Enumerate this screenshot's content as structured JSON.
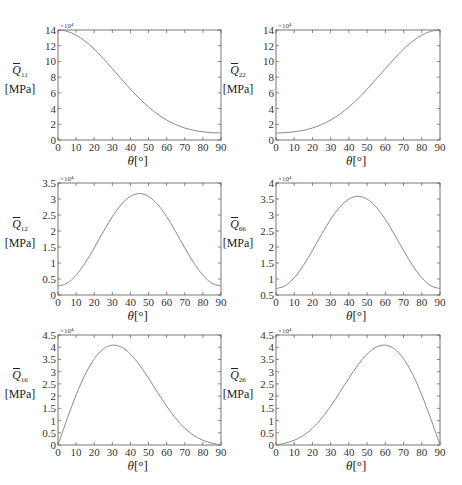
{
  "figure": {
    "xlabel_symbol": "θ",
    "xlabel_unit": "[°]",
    "ylabel_unit": "[MPa]",
    "multiplier": "×10⁴",
    "line_color": "#8a8a8a",
    "axis_color": "#555555"
  },
  "chart_data": [
    {
      "type": "line",
      "id": "Q11",
      "title": "",
      "ylabel_symbol": "Q",
      "ylabel_sub": "11",
      "ylabel": "Q̄11 [MPa]",
      "xlabel": "θ[°]",
      "multiplier": "×10^4",
      "xlim": [
        0,
        90
      ],
      "ylim": [
        0,
        14
      ],
      "xticks": [
        0,
        10,
        20,
        30,
        40,
        50,
        60,
        70,
        80,
        90
      ],
      "yticks": [
        0,
        2,
        4,
        6,
        8,
        10,
        12,
        14
      ],
      "ytick_labels": [
        "0",
        "2",
        "4",
        "6",
        "8",
        "10",
        "12",
        "14"
      ],
      "x": [
        0,
        5,
        10,
        15,
        20,
        25,
        30,
        35,
        40,
        45,
        50,
        55,
        60,
        65,
        70,
        75,
        80,
        85,
        90
      ],
      "values": [
        14.0,
        13.835,
        13.35,
        12.576,
        11.565,
        10.378,
        9.086,
        7.761,
        6.468,
        5.265,
        4.194,
        3.28,
        2.536,
        1.958,
        1.53,
        1.231,
        1.039,
        0.934,
        0.9
      ]
    },
    {
      "type": "line",
      "id": "Q22",
      "title": "",
      "ylabel_symbol": "Q",
      "ylabel_sub": "22",
      "ylabel": "Q̄22 [MPa]",
      "xlabel": "θ[°]",
      "multiplier": "×10^4",
      "xlim": [
        0,
        90
      ],
      "ylim": [
        0,
        14
      ],
      "xticks": [
        0,
        10,
        20,
        30,
        40,
        50,
        60,
        70,
        80,
        90
      ],
      "yticks": [
        0,
        2,
        4,
        6,
        8,
        10,
        12,
        14
      ],
      "ytick_labels": [
        "0",
        "2",
        "4",
        "6",
        "8",
        "10",
        "12",
        "14"
      ],
      "x": [
        0,
        5,
        10,
        15,
        20,
        25,
        30,
        35,
        40,
        45,
        50,
        55,
        60,
        65,
        70,
        75,
        80,
        85,
        90
      ],
      "values": [
        0.9,
        0.934,
        1.039,
        1.231,
        1.53,
        1.958,
        2.536,
        3.28,
        4.194,
        5.265,
        6.468,
        7.761,
        9.086,
        10.378,
        11.565,
        12.576,
        13.35,
        13.835,
        14.0
      ]
    },
    {
      "type": "line",
      "id": "Q12",
      "title": "",
      "ylabel_symbol": "Q",
      "ylabel_sub": "12",
      "ylabel": "Q̄12 [MPa]",
      "xlabel": "θ[°]",
      "multiplier": "×10^4",
      "xlim": [
        0,
        90
      ],
      "ylim": [
        0,
        3.5
      ],
      "xticks": [
        0,
        10,
        20,
        30,
        40,
        50,
        60,
        70,
        80,
        90
      ],
      "yticks": [
        0,
        0.5,
        1,
        1.5,
        2,
        2.5,
        3,
        3.5
      ],
      "ytick_labels": [
        "0",
        "0.5",
        "1",
        "1.5",
        "2",
        "2.5",
        "3",
        "3.5"
      ],
      "x": [
        0,
        5,
        10,
        15,
        20,
        25,
        30,
        35,
        40,
        45,
        50,
        55,
        60,
        65,
        70,
        75,
        80,
        85,
        90
      ],
      "values": [
        0.28,
        0.367,
        0.618,
        1.003,
        1.474,
        1.976,
        2.448,
        2.832,
        3.083,
        3.17,
        3.083,
        2.832,
        2.448,
        1.976,
        1.474,
        1.003,
        0.618,
        0.367,
        0.28
      ]
    },
    {
      "type": "line",
      "id": "Q66",
      "title": "",
      "ylabel_symbol": "Q",
      "ylabel_sub": "66",
      "ylabel": "Q̄66 [MPa]",
      "xlabel": "θ[°]",
      "multiplier": "×10^4",
      "xlim": [
        0,
        90
      ],
      "ylim": [
        0.5,
        4
      ],
      "xticks": [
        0,
        10,
        20,
        30,
        40,
        50,
        60,
        70,
        80,
        90
      ],
      "yticks": [
        0.5,
        1,
        1.5,
        2,
        2.5,
        3,
        3.5,
        4
      ],
      "ytick_labels": [
        "0.5",
        "1",
        "1.5",
        "2",
        "2.5",
        "3",
        "3.5",
        "4"
      ],
      "x": [
        0,
        5,
        10,
        15,
        20,
        25,
        30,
        35,
        40,
        45,
        50,
        55,
        60,
        65,
        70,
        75,
        80,
        85,
        90
      ],
      "values": [
        0.7,
        0.787,
        1.037,
        1.421,
        1.892,
        2.393,
        2.864,
        3.248,
        3.498,
        3.585,
        3.498,
        3.248,
        2.864,
        2.393,
        1.892,
        1.421,
        1.037,
        0.787,
        0.7
      ]
    },
    {
      "type": "line",
      "id": "Q16",
      "title": "",
      "ylabel_symbol": "Q",
      "ylabel_sub": "16",
      "ylabel": "Q̄16 [MPa]",
      "xlabel": "θ[°]",
      "multiplier": "×10^4",
      "xlim": [
        0,
        90
      ],
      "ylim": [
        0,
        4.5
      ],
      "xticks": [
        0,
        10,
        20,
        30,
        40,
        50,
        60,
        70,
        80,
        90
      ],
      "yticks": [
        0,
        0.5,
        1,
        1.5,
        2,
        2.5,
        3,
        3.5,
        4,
        4.5
      ],
      "ytick_labels": [
        "0",
        "0.5",
        "1",
        "1.5",
        "2",
        "2.5",
        "3",
        "3.5",
        "4",
        "4.5"
      ],
      "x": [
        0,
        5,
        10,
        15,
        20,
        25,
        30,
        35,
        40,
        45,
        50,
        55,
        60,
        65,
        70,
        75,
        80,
        85,
        90
      ],
      "values": [
        0,
        1.062,
        2.047,
        2.887,
        3.526,
        3.929,
        4.085,
        4.005,
        3.719,
        3.275,
        2.732,
        2.15,
        1.587,
        1.088,
        0.685,
        0.388,
        0.193,
        0.075,
        0
      ]
    },
    {
      "type": "line",
      "id": "Q26",
      "title": "",
      "ylabel_symbol": "Q",
      "ylabel_sub": "26",
      "ylabel": "Q̄26 [MPa]",
      "xlabel": "θ[°]",
      "multiplier": "×10^4",
      "xlim": [
        0,
        90
      ],
      "ylim": [
        0,
        4.5
      ],
      "xticks": [
        0,
        10,
        20,
        30,
        40,
        50,
        60,
        70,
        80,
        90
      ],
      "yticks": [
        0,
        0.5,
        1,
        1.5,
        2,
        2.5,
        3,
        3.5,
        4,
        4.5
      ],
      "ytick_labels": [
        "0",
        "0.5",
        "1",
        "1.5",
        "2",
        "2.5",
        "3",
        "3.5",
        "4",
        "4.5"
      ],
      "x": [
        0,
        5,
        10,
        15,
        20,
        25,
        30,
        35,
        40,
        45,
        50,
        55,
        60,
        65,
        70,
        75,
        80,
        85,
        90
      ],
      "values": [
        0,
        0.075,
        0.193,
        0.388,
        0.685,
        1.088,
        1.587,
        2.15,
        2.732,
        3.275,
        3.719,
        4.005,
        4.085,
        3.929,
        3.526,
        2.887,
        2.047,
        1.062,
        0
      ]
    }
  ]
}
